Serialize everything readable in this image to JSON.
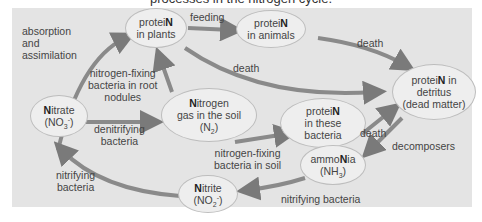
{
  "caption": "processes in the nitrogen cycle.",
  "colors": {
    "panel_bg": "#e4e4e4",
    "node_bg": "#eeeeee",
    "node_border": "#bdbdbd",
    "arrow": "#7a7a7a",
    "text": "#444444"
  },
  "nodes": {
    "protein_plants": {
      "bold": "N",
      "pre": "protei",
      "line2": "in plants"
    },
    "protein_animals": {
      "bold": "N",
      "pre": "protei",
      "line2": "in animals"
    },
    "protein_detritus": {
      "pre": "protei",
      "bold": "N",
      "post": " in",
      "line2": "detritus",
      "line3": "(dead matter)"
    },
    "nitrate": {
      "bold": "N",
      "post": "itrate",
      "formula_base": "(NO",
      "formula_sub": "3",
      "formula_sup": "-",
      "formula_end": ")"
    },
    "nitrogen_gas": {
      "bold": "N",
      "post": "itrogen",
      "line2": "gas in the soil",
      "formula_base": "(N",
      "formula_sub": "2",
      "formula_end": ")"
    },
    "protein_bacteria": {
      "pre": "protei",
      "bold": "N",
      "line2": "in these",
      "line3": "bacteria"
    },
    "ammonia": {
      "pre": "ammo",
      "bold": "N",
      "post": "ia",
      "formula_base": "(NH",
      "formula_sub": "3",
      "formula_end": ")"
    },
    "nitrite": {
      "bold": "N",
      "post": "itrite",
      "formula_base": "(NO",
      "formula_sub": "2",
      "formula_sup": "-",
      "formula_end": ")"
    }
  },
  "labels": {
    "absorption": [
      "absorption",
      "and",
      "assimilation"
    ],
    "feeding": "feeding",
    "death_animals": "death",
    "death_plants": "death",
    "nitrogen_fixing_root": [
      "nitrogen-fixing",
      "bacteria in root",
      "nodules"
    ],
    "denitrifying": [
      "denitrifying",
      "bacteria"
    ],
    "nitrogen_fixing_soil": [
      "nitrogen-fixing",
      "bacteria in soil"
    ],
    "death_bacteria": "death",
    "decomposers": "decomposers",
    "nitrifying_left": [
      "nitrifying",
      "bacteria"
    ],
    "nitrifying_bottom": "nitrifying bacteria"
  }
}
